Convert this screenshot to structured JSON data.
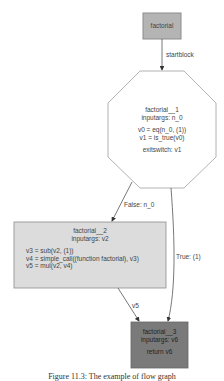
{
  "colors": {
    "start_fill": "#b4b4b4",
    "block_fill": "#dcdcdc",
    "return_fill": "#7a7a7a",
    "stroke": "#8c8c8c",
    "edge": "#555555"
  },
  "nodes": {
    "start": {
      "label": "factorial"
    },
    "block1": {
      "title": "factorial__1",
      "inputargs": "inputargs: n_0",
      "ops": [
        "v0 = eq(n_0, (1))",
        "v1 = is_true(v0)"
      ],
      "exitswitch": "exitswitch: v1"
    },
    "block2": {
      "title": "factorial__2",
      "inputargs": "inputargs: v2",
      "ops": [
        "v3 = sub(v2, (1))",
        "v4 = simple_call((function factorial), v3)",
        "v5 = mul(v2, v4)"
      ]
    },
    "block3": {
      "title": "factorial__3",
      "inputargs": "inputargs: v6",
      "ret": "return v6"
    }
  },
  "edges": [
    {
      "from": "start",
      "to": "block1",
      "label": "startblock"
    },
    {
      "from": "block1",
      "to": "block2",
      "label": "False: n_0"
    },
    {
      "from": "block1",
      "to": "block3",
      "label": "True: (1)"
    },
    {
      "from": "block2",
      "to": "block3",
      "label": "v5"
    }
  ],
  "caption": "Figure 11.3: The example of flow graph"
}
